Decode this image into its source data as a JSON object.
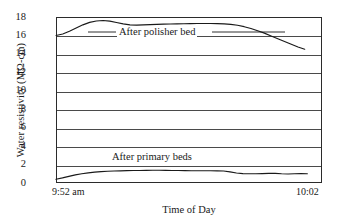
{
  "chart_data": {
    "type": "line",
    "title": "",
    "xlabel": "Time of Day",
    "ylabel": "Water resistivity (MΩ-cm)",
    "ylim": [
      0,
      18
    ],
    "yticks": [
      0,
      2,
      4,
      6,
      8,
      10,
      12,
      14,
      16,
      18
    ],
    "ytick_labels": [
      "0",
      "2",
      "4",
      "6",
      "8",
      "10",
      "12",
      "14",
      "16",
      "18"
    ],
    "xtick_labels": [
      "9:52 am",
      "10:02"
    ],
    "xlim_labels": {
      "left": "9:52 am",
      "right": "10:02"
    },
    "grid": "horizontal",
    "legend": "inline-annotations",
    "line_color": "#1a1a1a",
    "frame_color": "#2b2b2b",
    "background": "#ffffff",
    "series": [
      {
        "name": "After polisher bed",
        "annotation": "After polisher bed",
        "x": [
          0,
          1,
          2,
          3,
          4,
          5,
          6,
          7,
          8,
          9,
          10,
          11,
          12,
          13,
          14,
          15,
          16,
          17,
          18,
          19,
          20,
          21,
          22,
          23,
          24,
          25,
          26,
          27,
          28,
          29,
          30,
          31,
          32,
          33,
          34,
          35,
          36,
          37
        ],
        "values": [
          16.0,
          16.15,
          16.45,
          16.8,
          17.15,
          17.42,
          17.57,
          17.62,
          17.55,
          17.4,
          17.25,
          17.15,
          17.12,
          17.14,
          17.17,
          17.2,
          17.22,
          17.24,
          17.26,
          17.27,
          17.28,
          17.3,
          17.3,
          17.3,
          17.28,
          17.25,
          17.2,
          17.1,
          16.95,
          16.75,
          16.5,
          16.25,
          15.95,
          15.65,
          15.35,
          15.05,
          14.75,
          14.5
        ]
      },
      {
        "name": "After primary beds",
        "annotation": "After primary beds",
        "x": [
          0,
          1,
          2,
          3,
          4,
          5,
          6,
          7,
          8,
          9,
          10,
          11,
          12,
          13,
          14,
          15,
          16,
          17,
          18,
          19,
          20,
          21,
          22,
          23,
          24,
          25,
          26,
          27,
          28,
          29,
          30,
          31,
          32,
          33,
          34,
          35,
          36,
          37,
          38,
          39
        ],
        "values": [
          0.4,
          0.55,
          0.72,
          0.88,
          1.0,
          1.1,
          1.18,
          1.24,
          1.28,
          1.3,
          1.32,
          1.34,
          1.35,
          1.36,
          1.37,
          1.38,
          1.38,
          1.37,
          1.36,
          1.35,
          1.34,
          1.33,
          1.33,
          1.33,
          1.33,
          1.32,
          1.3,
          1.2,
          1.08,
          1.02,
          1.0,
          1.0,
          1.02,
          1.05,
          1.04,
          1.0,
          0.98,
          1.0,
          1.02,
          1.0
        ]
      }
    ]
  }
}
